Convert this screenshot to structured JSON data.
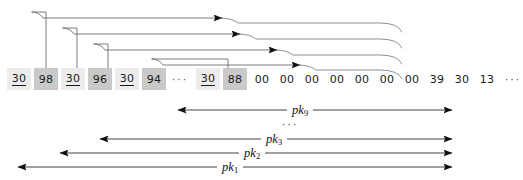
{
  "diagram": {
    "stroke_color": "#6e6e6e",
    "arrow_color": "#111111",
    "cell_light_color": "#ececec",
    "cell_dark_color": "#c9c9c9"
  },
  "memory": {
    "cells": [
      {
        "value": "30",
        "style": "light",
        "underline": true,
        "x": 7
      },
      {
        "value": "98",
        "style": "dark",
        "underline": false,
        "x": 34
      },
      {
        "value": "30",
        "style": "light",
        "underline": true,
        "x": 61
      },
      {
        "value": "96",
        "style": "dark",
        "underline": false,
        "x": 88
      },
      {
        "value": "30",
        "style": "light",
        "underline": true,
        "x": 115
      },
      {
        "value": "94",
        "style": "dark",
        "underline": false,
        "x": 142
      },
      {
        "value": "30",
        "style": "light",
        "underline": true,
        "x": 196
      },
      {
        "value": "88",
        "style": "dark",
        "underline": false,
        "x": 223
      },
      {
        "value": "00",
        "style": "plain",
        "underline": false,
        "x": 250
      },
      {
        "value": "00",
        "style": "plain",
        "underline": false,
        "x": 275
      },
      {
        "value": "00",
        "style": "plain",
        "underline": false,
        "x": 300
      },
      {
        "value": "00",
        "style": "plain",
        "underline": false,
        "x": 325
      },
      {
        "value": "00",
        "style": "plain",
        "underline": false,
        "x": 350
      },
      {
        "value": "00",
        "style": "plain",
        "underline": false,
        "x": 375
      },
      {
        "value": "00",
        "style": "plain",
        "underline": false,
        "x": 400
      },
      {
        "value": "39",
        "style": "plain",
        "underline": false,
        "x": 425
      },
      {
        "value": "30",
        "style": "plain",
        "underline": false,
        "x": 450
      },
      {
        "value": "13",
        "style": "plain",
        "underline": false,
        "x": 475
      }
    ],
    "ellipses": [
      {
        "glyph": "···",
        "x": 167,
        "width": 26
      },
      {
        "glyph": "···",
        "x": 500,
        "width": 26
      }
    ]
  },
  "pointers": [
    {
      "name": "pointer-from-98",
      "source_value": "98",
      "stem_x": 46,
      "top_y": 12,
      "left_x": 32,
      "arrow_x": 222,
      "right_end_x": 398
    },
    {
      "name": "pointer-from-96",
      "source_value": "96",
      "stem_x": 77,
      "top_y": 28,
      "left_x": 63,
      "arrow_x": 240,
      "right_end_x": 398
    },
    {
      "name": "pointer-from-94",
      "source_value": "94",
      "stem_x": 108,
      "top_y": 44,
      "left_x": 94,
      "arrow_x": 277,
      "right_end_x": 398
    },
    {
      "name": "pointer-from-88",
      "source_value": "88",
      "stem_x": 228,
      "top_y": 59,
      "left_x": 152,
      "arrow_x": 300,
      "right_end_x": 398
    }
  ],
  "ranges": [
    {
      "label": "pk",
      "subscript": "9",
      "y": 110,
      "x1": 178,
      "x2": 452,
      "label_x": 300
    },
    {
      "label": "pk",
      "subscript": "3",
      "y": 139,
      "x1": 100,
      "x2": 452,
      "label_x": 274
    },
    {
      "label": "pk",
      "subscript": "2",
      "y": 153,
      "x1": 60,
      "x2": 452,
      "label_x": 252
    },
    {
      "label": "pk",
      "subscript": "1",
      "y": 167,
      "x1": 18,
      "x2": 452,
      "label_x": 230
    }
  ],
  "range_gap": {
    "glyph": "···",
    "x": 290,
    "y": 124
  }
}
